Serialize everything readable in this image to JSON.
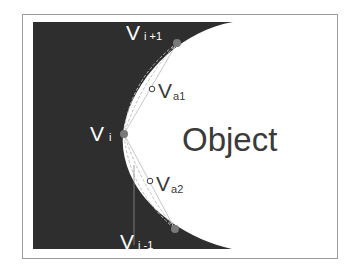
{
  "diagram": {
    "colors": {
      "background": "#ffffff",
      "frame": "#9a9a9a",
      "dark_region": "#2e2e2e",
      "object_region": "#ffffff",
      "vertex_fill": "#7a7a7a",
      "label_on_dark": "#ffffff",
      "label_on_light": "#3a3a3a",
      "guide_lines": "#bdbdbd"
    },
    "region_label": "Object",
    "vertices": [
      {
        "id": "v_i_plus_1",
        "label": "V",
        "subscript": "i +1",
        "x": 177,
        "y": 43
      },
      {
        "id": "v_i",
        "label": "V",
        "subscript": "i",
        "x": 124,
        "y": 134
      },
      {
        "id": "v_i_minus_1",
        "label": "V",
        "subscript": "i -1",
        "x": 175,
        "y": 229
      }
    ],
    "auxiliary_points": [
      {
        "id": "v_a1",
        "label": "V",
        "subscript": "a1",
        "x": 152,
        "y": 89
      },
      {
        "id": "v_a2",
        "label": "V",
        "subscript": "a2",
        "x": 150,
        "y": 181
      }
    ]
  }
}
